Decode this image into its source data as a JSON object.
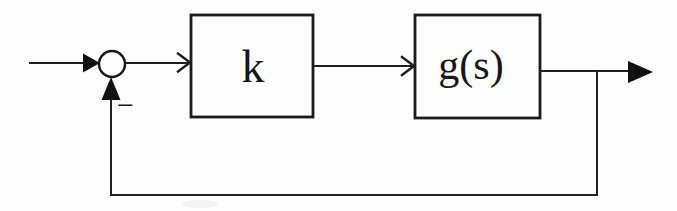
{
  "diagram": {
    "type": "control-system-feedback-block-diagram",
    "background_color": "#fdfdfd",
    "ink_color": "#1b1b1b",
    "blocks": [
      {
        "id": "gain",
        "label": "k"
      },
      {
        "id": "plant",
        "label": "g(s)"
      }
    ],
    "summing_junction": {
      "shape": "circle",
      "feedback_sign": "−"
    },
    "connections": [
      "input → summing-junction (filled arrowhead)",
      "summing-junction → gain block k (open chevron arrowhead)",
      "gain block k → plant block g(s) (open chevron arrowhead)",
      "plant block g(s) → output (filled arrowhead)",
      "takeoff point after g(s) → down → left → up into summing-junction bottom (filled arrowhead, negative sign)"
    ]
  }
}
